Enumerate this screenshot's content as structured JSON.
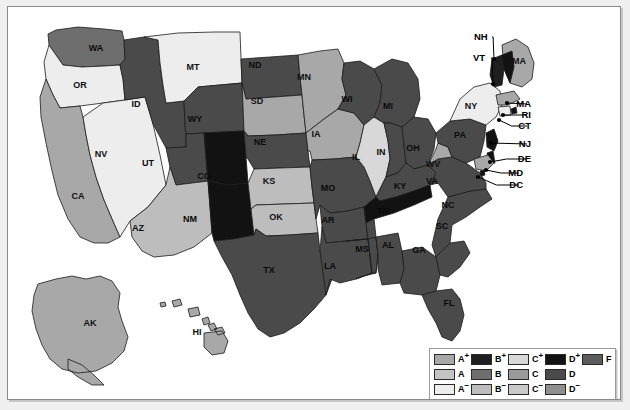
{
  "figure": {
    "kind": "us-choropleth-grade-map",
    "background": "#ffffff",
    "frame_color": "#8a8a8a"
  },
  "palette": {
    "A_plus": "#a8a8a8",
    "A": "#c4c4c4",
    "A_minus": "#ededed",
    "B_plus": "#1f1f1f",
    "B": "#6e6e6e",
    "B_minus": "#bdbdbd",
    "C_plus": "#d8d8d8",
    "C": "#9a9a9a",
    "C_minus": "#c9c9c9",
    "D_plus": "#121212",
    "D": "#4a4a4a",
    "D_minus": "#8f8f8f",
    "F": "#5c5c5c",
    "ocean": "#ffffff",
    "outline": "#1a1a1a"
  },
  "legend": {
    "name": "grade-legend",
    "columns": 5,
    "rows": 3,
    "entries": [
      {
        "grade": "A",
        "sup": "+",
        "color": "#a8a8a8",
        "col": 1,
        "row": 1
      },
      {
        "grade": "B",
        "sup": "+",
        "color": "#1f1f1f",
        "col": 2,
        "row": 1
      },
      {
        "grade": "C",
        "sup": "+",
        "color": "#d8d8d8",
        "col": 3,
        "row": 1
      },
      {
        "grade": "D",
        "sup": "+",
        "color": "#121212",
        "col": 4,
        "row": 1
      },
      {
        "grade": "F",
        "sup": "",
        "color": "#5c5c5c",
        "col": 5,
        "row": 1
      },
      {
        "grade": "A",
        "sup": "",
        "color": "#c4c4c4",
        "col": 1,
        "row": 2
      },
      {
        "grade": "B",
        "sup": "",
        "color": "#6e6e6e",
        "col": 2,
        "row": 2
      },
      {
        "grade": "C",
        "sup": "",
        "color": "#9a9a9a",
        "col": 3,
        "row": 2
      },
      {
        "grade": "D",
        "sup": "",
        "color": "#4a4a4a",
        "col": 4,
        "row": 2
      },
      {
        "grade": "A",
        "sup": "−",
        "color": "#ededed",
        "col": 1,
        "row": 3
      },
      {
        "grade": "B",
        "sup": "−",
        "color": "#bdbdbd",
        "col": 2,
        "row": 3
      },
      {
        "grade": "C",
        "sup": "−",
        "color": "#c9c9c9",
        "col": 3,
        "row": 3
      },
      {
        "grade": "D",
        "sup": "−",
        "color": "#8f8f8f",
        "col": 4,
        "row": 3
      }
    ]
  },
  "chart_data": {
    "type": "heatmap",
    "title": "",
    "xlabel": "",
    "ylabel": "",
    "legend_position": "bottom-right",
    "categories": [
      "A+",
      "A",
      "A−",
      "B+",
      "B",
      "B−",
      "C+",
      "C",
      "C−",
      "D+",
      "D",
      "D−",
      "F"
    ],
    "states": [
      {
        "code": "WA",
        "grade": "B",
        "color": "#6e6e6e"
      },
      {
        "code": "OR",
        "grade": "A−",
        "color": "#ededed"
      },
      {
        "code": "ID",
        "grade": "D",
        "color": "#4a4a4a"
      },
      {
        "code": "MT",
        "grade": "A−",
        "color": "#ededed"
      },
      {
        "code": "WY",
        "grade": "D",
        "color": "#4a4a4a"
      },
      {
        "code": "NV",
        "grade": "A−",
        "color": "#ededed"
      },
      {
        "code": "UT",
        "grade": "D",
        "color": "#4a4a4a"
      },
      {
        "code": "CO",
        "grade": "D+",
        "color": "#121212"
      },
      {
        "code": "CA",
        "grade": "A+",
        "color": "#a8a8a8"
      },
      {
        "code": "AZ",
        "grade": "B−",
        "color": "#bdbdbd"
      },
      {
        "code": "NM",
        "grade": "D+",
        "color": "#121212"
      },
      {
        "code": "ND",
        "grade": "D",
        "color": "#4a4a4a"
      },
      {
        "code": "SD",
        "grade": "A+",
        "color": "#a8a8a8"
      },
      {
        "code": "NE",
        "grade": "D",
        "color": "#4a4a4a"
      },
      {
        "code": "KS",
        "grade": "B−",
        "color": "#bdbdbd"
      },
      {
        "code": "OK",
        "grade": "B−",
        "color": "#bdbdbd"
      },
      {
        "code": "TX",
        "grade": "D",
        "color": "#4a4a4a"
      },
      {
        "code": "MN",
        "grade": "A+",
        "color": "#a8a8a8"
      },
      {
        "code": "IA",
        "grade": "A+",
        "color": "#a8a8a8"
      },
      {
        "code": "MO",
        "grade": "D",
        "color": "#4a4a4a"
      },
      {
        "code": "AR",
        "grade": "D",
        "color": "#4a4a4a"
      },
      {
        "code": "LA",
        "grade": "D",
        "color": "#4a4a4a"
      },
      {
        "code": "WI",
        "grade": "D",
        "color": "#4a4a4a"
      },
      {
        "code": "IL",
        "grade": "C+",
        "color": "#d8d8d8"
      },
      {
        "code": "MI",
        "grade": "D",
        "color": "#4a4a4a"
      },
      {
        "code": "IN",
        "grade": "D",
        "color": "#4a4a4a"
      },
      {
        "code": "OH",
        "grade": "D",
        "color": "#4a4a4a"
      },
      {
        "code": "KY",
        "grade": "D",
        "color": "#4a4a4a"
      },
      {
        "code": "TN",
        "grade": "D+",
        "color": "#121212"
      },
      {
        "code": "MS",
        "grade": "D",
        "color": "#4a4a4a"
      },
      {
        "code": "AL",
        "grade": "D",
        "color": "#4a4a4a"
      },
      {
        "code": "GA",
        "grade": "D",
        "color": "#4a4a4a"
      },
      {
        "code": "FL",
        "grade": "D",
        "color": "#4a4a4a"
      },
      {
        "code": "SC",
        "grade": "D",
        "color": "#4a4a4a"
      },
      {
        "code": "NC",
        "grade": "D",
        "color": "#4a4a4a"
      },
      {
        "code": "VA",
        "grade": "D",
        "color": "#4a4a4a"
      },
      {
        "code": "WV",
        "grade": "A+",
        "color": "#a8a8a8"
      },
      {
        "code": "PA",
        "grade": "D",
        "color": "#4a4a4a"
      },
      {
        "code": "NY",
        "grade": "A−",
        "color": "#ededed"
      },
      {
        "code": "MA",
        "grade": "A+",
        "color": "#a8a8a8"
      },
      {
        "code": "VT",
        "grade": "B+",
        "color": "#1f1f1f"
      },
      {
        "code": "NH",
        "grade": "D+",
        "color": "#121212"
      },
      {
        "code": "RI",
        "grade": "D+",
        "color": "#121212"
      },
      {
        "code": "CT",
        "grade": "A−",
        "color": "#ededed"
      },
      {
        "code": "NJ",
        "grade": "D+",
        "color": "#121212"
      },
      {
        "code": "DE",
        "grade": "D+",
        "color": "#121212"
      },
      {
        "code": "MD",
        "grade": "A+",
        "color": "#a8a8a8"
      },
      {
        "code": "DC",
        "grade": "D+",
        "color": "#121212"
      },
      {
        "code": "AK",
        "grade": "A+",
        "color": "#a8a8a8"
      },
      {
        "code": "HI",
        "grade": "A+",
        "color": "#a8a8a8"
      }
    ]
  },
  "map": {
    "inline_labels": [
      {
        "code": "WA",
        "x": 88,
        "y": 42,
        "tone": "dark"
      },
      {
        "code": "OR",
        "x": 72,
        "y": 79,
        "tone": "light"
      },
      {
        "code": "ID",
        "x": 128,
        "y": 98,
        "tone": "dark"
      },
      {
        "code": "MT",
        "x": 185,
        "y": 61,
        "tone": "light"
      },
      {
        "code": "WY",
        "x": 187,
        "y": 113,
        "tone": "dark"
      },
      {
        "code": "NV",
        "x": 93,
        "y": 148,
        "tone": "light"
      },
      {
        "code": "UT",
        "x": 140,
        "y": 157,
        "tone": "dark"
      },
      {
        "code": "CO",
        "x": 196,
        "y": 170,
        "tone": "dark"
      },
      {
        "code": "CA",
        "x": 70,
        "y": 190,
        "tone": "light"
      },
      {
        "code": "AZ",
        "x": 130,
        "y": 222,
        "tone": "light"
      },
      {
        "code": "NM",
        "x": 182,
        "y": 213,
        "tone": "dark"
      },
      {
        "code": "ND",
        "x": 247,
        "y": 59,
        "tone": "dark"
      },
      {
        "code": "SD",
        "x": 249,
        "y": 95,
        "tone": "light"
      },
      {
        "code": "NE",
        "x": 252,
        "y": 136,
        "tone": "dark"
      },
      {
        "code": "KS",
        "x": 261,
        "y": 175,
        "tone": "light"
      },
      {
        "code": "OK",
        "x": 268,
        "y": 211,
        "tone": "light"
      },
      {
        "code": "TX",
        "x": 261,
        "y": 264,
        "tone": "dark"
      },
      {
        "code": "MN",
        "x": 296,
        "y": 71,
        "tone": "light"
      },
      {
        "code": "IA",
        "x": 308,
        "y": 128,
        "tone": "light"
      },
      {
        "code": "MO",
        "x": 320,
        "y": 182,
        "tone": "dark"
      },
      {
        "code": "AR",
        "x": 320,
        "y": 214,
        "tone": "dark"
      },
      {
        "code": "LA",
        "x": 322,
        "y": 260,
        "tone": "dark"
      },
      {
        "code": "WI",
        "x": 339,
        "y": 93,
        "tone": "dark"
      },
      {
        "code": "IL",
        "x": 348,
        "y": 151,
        "tone": "light"
      },
      {
        "code": "MI",
        "x": 380,
        "y": 100,
        "tone": "dark"
      },
      {
        "code": "IN",
        "x": 373,
        "y": 146,
        "tone": "dark"
      },
      {
        "code": "OH",
        "x": 405,
        "y": 142,
        "tone": "dark"
      },
      {
        "code": "KY",
        "x": 392,
        "y": 180,
        "tone": "dark"
      },
      {
        "code": "TN",
        "x": 375,
        "y": 205,
        "tone": "dark"
      },
      {
        "code": "MS",
        "x": 354,
        "y": 243,
        "tone": "dark"
      },
      {
        "code": "AL",
        "x": 380,
        "y": 239,
        "tone": "dark"
      },
      {
        "code": "GA",
        "x": 411,
        "y": 244,
        "tone": "dark"
      },
      {
        "code": "FL",
        "x": 441,
        "y": 297,
        "tone": "dark"
      },
      {
        "code": "SC",
        "x": 434,
        "y": 220,
        "tone": "dark"
      },
      {
        "code": "NC",
        "x": 440,
        "y": 199,
        "tone": "dark"
      },
      {
        "code": "VA",
        "x": 424,
        "y": 175,
        "tone": "dark"
      },
      {
        "code": "WV",
        "x": 425,
        "y": 158,
        "tone": "light"
      },
      {
        "code": "PA",
        "x": 452,
        "y": 129,
        "tone": "dark"
      },
      {
        "code": "NY",
        "x": 463,
        "y": 100,
        "tone": "light"
      },
      {
        "code": "MA",
        "x": 511,
        "y": 55,
        "tone": "light"
      },
      {
        "code": "AK",
        "x": 82,
        "y": 317,
        "tone": "light"
      },
      {
        "code": "HI",
        "x": 189,
        "y": 326,
        "tone": "light"
      }
    ],
    "callouts": [
      {
        "code": "NH",
        "label_x": 466,
        "label_y": 30,
        "dot_x": 486,
        "dot_y": 52
      },
      {
        "code": "VT",
        "label_x": 465,
        "label_y": 51,
        "dot_x": 485,
        "dot_y": 77
      },
      {
        "code": "MA",
        "label_x": 523,
        "label_y": 97,
        "dot_x": 499,
        "dot_y": 96
      },
      {
        "code": "RI",
        "label_x": 523,
        "label_y": 108,
        "dot_x": 495,
        "dot_y": 108
      },
      {
        "code": "CT",
        "label_x": 523,
        "label_y": 119,
        "dot_x": 491,
        "dot_y": 113
      },
      {
        "code": "NJ",
        "label_x": 523,
        "label_y": 137,
        "dot_x": 483,
        "dot_y": 136
      },
      {
        "code": "DE",
        "label_x": 523,
        "label_y": 152,
        "dot_x": 482,
        "dot_y": 155
      },
      {
        "code": "MD",
        "label_x": 515,
        "label_y": 166,
        "dot_x": 478,
        "dot_y": 163
      },
      {
        "code": "DC",
        "label_x": 515,
        "label_y": 178,
        "dot_x": 470,
        "dot_y": 170
      }
    ]
  }
}
